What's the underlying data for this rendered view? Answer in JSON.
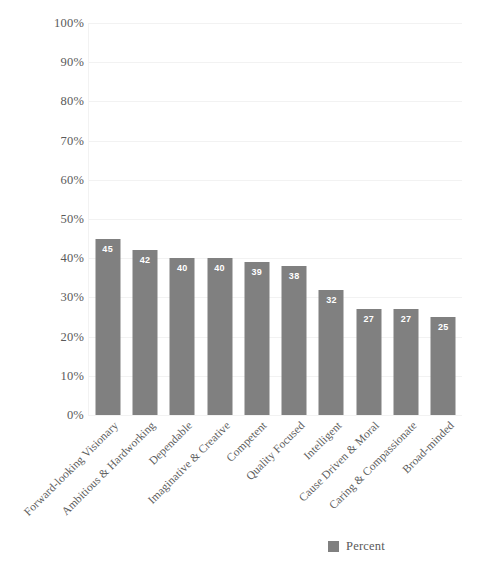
{
  "chart_data": {
    "type": "bar",
    "title": "",
    "subtitle": "",
    "xlabel": "",
    "ylabel": "",
    "ylim": [
      0,
      100
    ],
    "ytick_labels": [
      "100%",
      "90%",
      "80%",
      "70%",
      "60%",
      "50%",
      "40%",
      "30%",
      "20%",
      "10%",
      "0%"
    ],
    "ytick_values": [
      100,
      90,
      80,
      70,
      60,
      50,
      40,
      30,
      20,
      10,
      0
    ],
    "grid": true,
    "grid_axis": "y",
    "legend_position": "bottom-right",
    "categories": [
      "Forward-looking Visionary",
      "Ambitious & Hardworking",
      "Dependable",
      "Imaginative & Creative",
      "Competent",
      "Quality Focused",
      "Intelligent",
      "Cause Driven & Moral",
      "Caring & Compassionate",
      "Broad-minded"
    ],
    "series": [
      {
        "name": "Percent",
        "color": "#808080",
        "values": [
          45,
          42,
          40,
          40,
          39,
          38,
          32,
          27,
          27,
          25
        ],
        "data_labels": [
          "45",
          "42",
          "40",
          "40",
          "39",
          "38",
          "32",
          "27",
          "27",
          "25"
        ]
      }
    ]
  },
  "legend": {
    "items": [
      {
        "label": "Percent",
        "color": "#808080"
      }
    ]
  },
  "colors": {
    "bar": "#808080",
    "gridline": "#f2f2f2",
    "tick_text": "#5a5a5a",
    "label_text": "#ffffff",
    "background": "#ffffff"
  }
}
